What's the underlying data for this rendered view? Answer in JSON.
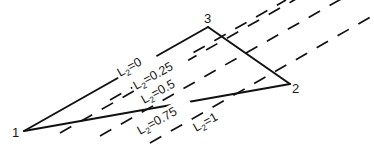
{
  "diagram": {
    "type": "triangle-with-level-lines",
    "vertices": [
      {
        "id": "1",
        "label": "1",
        "x": 24,
        "y": 131
      },
      {
        "id": "2",
        "label": "2",
        "x": 290,
        "y": 84
      },
      {
        "id": "3",
        "label": "3",
        "x": 208,
        "y": 27
      }
    ],
    "edges": [
      [
        "1",
        "3"
      ],
      [
        "3",
        "2"
      ],
      [
        "2",
        "1"
      ]
    ],
    "level_lines": [
      {
        "value": "0",
        "label_prefix": "L",
        "label_sub": "2",
        "label_suffix": "=0"
      },
      {
        "value": "0.25",
        "label_prefix": "L",
        "label_sub": "2",
        "label_suffix": "=0.25"
      },
      {
        "value": "0.5",
        "label_prefix": "L",
        "label_sub": "2",
        "label_suffix": "=0.5"
      },
      {
        "value": "0.75",
        "label_prefix": "L",
        "label_sub": "2",
        "label_suffix": "=0.75"
      },
      {
        "value": "1",
        "label_prefix": "L",
        "label_sub": "2",
        "label_suffix": "=1"
      }
    ]
  }
}
